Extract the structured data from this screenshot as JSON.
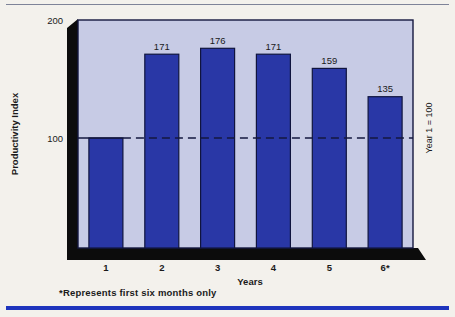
{
  "page": {
    "background": "#f3f1ec",
    "top_rule_color": "#7e8398",
    "bottom_rule_color": "#1e34bd"
  },
  "chart_data": {
    "type": "bar",
    "title": "",
    "categories": [
      "1",
      "2",
      "3",
      "4",
      "5",
      "6*"
    ],
    "values": [
      100,
      171,
      176,
      171,
      159,
      135
    ],
    "value_labels": [
      "",
      "171",
      "176",
      "171",
      "159",
      "135"
    ],
    "xlabel": "Years",
    "ylabel": "Productivity Index",
    "right_label": "Year 1 = 100",
    "y_ticks": [
      "200",
      "100"
    ],
    "ylim": [
      0,
      200
    ],
    "reference_line": 100,
    "footnote": "*Represents first six months only",
    "bar_color": "#2937a6",
    "bar_border_color": "#10143e",
    "plot_bg": "#c7cbe5",
    "plot_border_color": "#14183f",
    "pedestal_color": "#0c0c0c",
    "grid": false,
    "legend": "none"
  }
}
